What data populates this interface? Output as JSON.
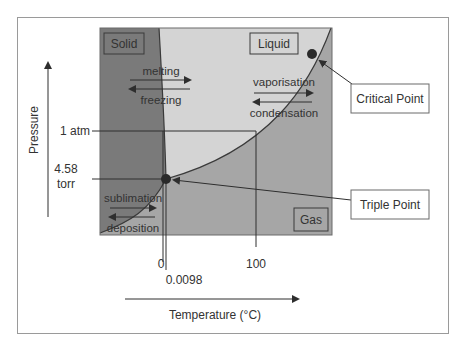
{
  "diagram": {
    "colors": {
      "solid": "#7a7a7a",
      "liquid": "#d4d4d4",
      "gas": "#a6a6a6",
      "line": "#2e2e2e",
      "text": "#333333",
      "frame": "#9a9a9a",
      "label_box_bg": "#ffffff"
    },
    "regions": {
      "solid": "Solid",
      "liquid": "Liquid",
      "gas": "Gas"
    },
    "transitions": {
      "melting": "melting",
      "freezing": "freezing",
      "vaporisation": "vaporisation",
      "condensation": "condensation",
      "sublimation": "sublimation",
      "deposition": "deposition"
    },
    "axes": {
      "y_label": "Pressure",
      "x_label": "Temperature (°C)",
      "y_ticks": {
        "atm": "1 atm",
        "triple_p_value": "4.58",
        "triple_p_unit": "torr"
      },
      "x_ticks": {
        "zero": "0",
        "triple_t": "0.0098",
        "boiling": "100"
      }
    },
    "callouts": {
      "critical_point": "Critical Point",
      "triple_point": "Triple Point"
    }
  }
}
